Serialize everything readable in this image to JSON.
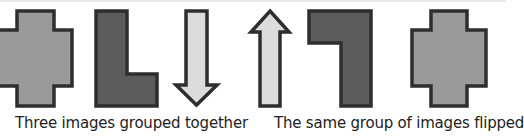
{
  "figure": {
    "left_group": {
      "caption": "Three images grouped together",
      "shapes": [
        {
          "name": "cross",
          "fill": "#9a9a9a"
        },
        {
          "name": "L-shape",
          "fill": "#5c5c5c"
        },
        {
          "name": "down-arrow",
          "fill": "#dcdcdc"
        }
      ]
    },
    "right_group": {
      "caption": "The same group of images flipped",
      "shapes": [
        {
          "name": "up-arrow",
          "fill": "#dcdcdc"
        },
        {
          "name": "flipped-L-shape",
          "fill": "#5c5c5c"
        },
        {
          "name": "cross",
          "fill": "#9a9a9a"
        }
      ]
    },
    "stroke_color": "#2e2e2e"
  }
}
